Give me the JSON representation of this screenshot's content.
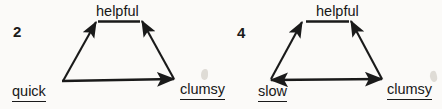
{
  "page": {
    "background_color": "#fbfaf8",
    "ink_color": "#1a1a1a",
    "width": 442,
    "height": 109
  },
  "diagrams": [
    {
      "item_number": "2",
      "nodes": {
        "top": "helpful",
        "bottom_left": "quick",
        "bottom_right": "clumsy"
      },
      "edges": [
        {
          "from": "quick",
          "to": "helpful",
          "arrow": "single",
          "direction": "up-right"
        },
        {
          "from": "clumsy",
          "to": "helpful",
          "arrow": "single",
          "direction": "up-left"
        },
        {
          "from": "quick",
          "to": "clumsy",
          "arrow": "single",
          "direction": "right"
        }
      ]
    },
    {
      "item_number": "4",
      "nodes": {
        "top": "helpful",
        "bottom_left": "slow",
        "bottom_right": "clumsy"
      },
      "edges": [
        {
          "from": "slow",
          "to": "helpful",
          "arrow": "single",
          "direction": "up-right"
        },
        {
          "from": "clumsy",
          "to": "helpful",
          "arrow": "single",
          "direction": "up-left"
        },
        {
          "from": "slow",
          "to": "clumsy",
          "arrow": "double",
          "direction": "both"
        }
      ]
    }
  ]
}
